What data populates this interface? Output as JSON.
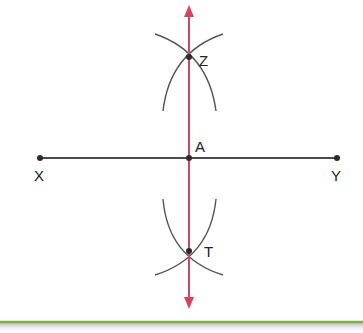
{
  "diagram": {
    "colors": {
      "segment": "#4a4a4a",
      "bisector": "#d6455f",
      "arc": "#555555",
      "point": "#2b2b2b",
      "ground": "#7fb23a"
    },
    "points": {
      "X": {
        "label": "X",
        "x": 40,
        "y": 158
      },
      "Y": {
        "label": "Y",
        "x": 337,
        "y": 158
      },
      "A": {
        "label": "A",
        "x": 189,
        "y": 158
      },
      "Z": {
        "label": "Z",
        "x": 189,
        "y": 57
      },
      "T": {
        "label": "T",
        "x": 189,
        "y": 251
      }
    },
    "segment": {
      "from": "X",
      "to": "Y"
    },
    "bisector": {
      "through": [
        "Z",
        "A",
        "T"
      ],
      "arrows": "both"
    }
  }
}
